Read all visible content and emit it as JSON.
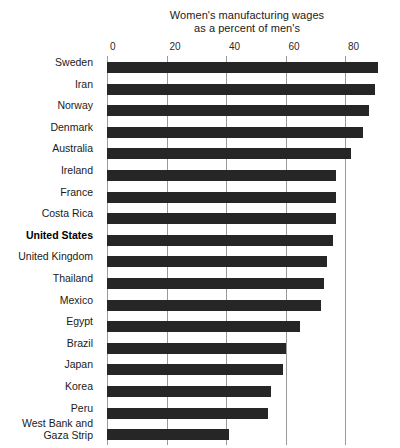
{
  "chart_data": {
    "type": "bar",
    "orientation": "horizontal",
    "title": "Women's manufacturing wages as a percent of men's",
    "title_lines": [
      "Women's manufacturing wages",
      "as a percent of men's"
    ],
    "xlabel": "",
    "ylabel": "",
    "xlim": [
      0,
      95
    ],
    "axis_ticks": [
      0,
      20,
      40,
      60,
      80
    ],
    "axis_tick_labels": [
      "0",
      "20",
      "40",
      "60",
      "80"
    ],
    "grid": "vertical",
    "legend": "none",
    "bar_color": "#262626",
    "gridline_color": "#9a9a9a",
    "categories": [
      "Sweden",
      "Iran",
      "Norway",
      "Denmark",
      "Australia",
      "Ireland",
      "France",
      "Costa Rica",
      "United States",
      "United Kingdom",
      "Thailand",
      "Mexico",
      "Egypt",
      "Brazil",
      "Japan",
      "Korea",
      "Peru",
      "West Bank and Gaza Strip"
    ],
    "values": [
      91,
      90,
      88,
      86,
      82,
      77,
      77,
      77,
      76,
      74,
      73,
      72,
      65,
      60,
      59,
      55,
      54,
      41
    ],
    "highlighted_category": "United States"
  },
  "rows": [
    {
      "label": "Sweden",
      "label_line1": "Sweden",
      "label_line2": "",
      "value": 91,
      "highlight": false
    },
    {
      "label": "Iran",
      "label_line1": "Iran",
      "label_line2": "",
      "value": 90,
      "highlight": false
    },
    {
      "label": "Norway",
      "label_line1": "Norway",
      "label_line2": "",
      "value": 88,
      "highlight": false
    },
    {
      "label": "Denmark",
      "label_line1": "Denmark",
      "label_line2": "",
      "value": 86,
      "highlight": false
    },
    {
      "label": "Australia",
      "label_line1": "Australia",
      "label_line2": "",
      "value": 82,
      "highlight": false
    },
    {
      "label": "Ireland",
      "label_line1": "Ireland",
      "label_line2": "",
      "value": 77,
      "highlight": false
    },
    {
      "label": "France",
      "label_line1": "France",
      "label_line2": "",
      "value": 77,
      "highlight": false
    },
    {
      "label": "Costa Rica",
      "label_line1": "Costa Rica",
      "label_line2": "",
      "value": 77,
      "highlight": false
    },
    {
      "label": "United States",
      "label_line1": "United States",
      "label_line2": "",
      "value": 76,
      "highlight": true
    },
    {
      "label": "United Kingdom",
      "label_line1": "United Kingdom",
      "label_line2": "",
      "value": 74,
      "highlight": false
    },
    {
      "label": "Thailand",
      "label_line1": "Thailand",
      "label_line2": "",
      "value": 73,
      "highlight": false
    },
    {
      "label": "Mexico",
      "label_line1": "Mexico",
      "label_line2": "",
      "value": 72,
      "highlight": false
    },
    {
      "label": "Egypt",
      "label_line1": "Egypt",
      "label_line2": "",
      "value": 65,
      "highlight": false
    },
    {
      "label": "Brazil",
      "label_line1": "Brazil",
      "label_line2": "",
      "value": 60,
      "highlight": false
    },
    {
      "label": "Japan",
      "label_line1": "Japan",
      "label_line2": "",
      "value": 59,
      "highlight": false
    },
    {
      "label": "Korea",
      "label_line1": "Korea",
      "label_line2": "",
      "value": 55,
      "highlight": false
    },
    {
      "label": "Peru",
      "label_line1": "Peru",
      "label_line2": "",
      "value": 54,
      "highlight": false
    },
    {
      "label": "West Bank and Gaza Strip",
      "label_line1": "West Bank and",
      "label_line2": "Gaza Strip",
      "value": 41,
      "highlight": false
    }
  ]
}
